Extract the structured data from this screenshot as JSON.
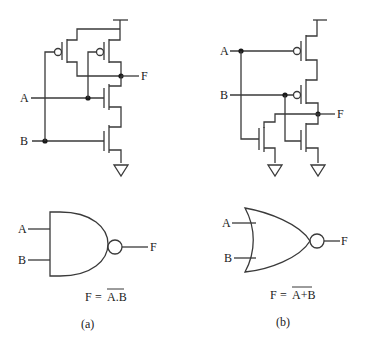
{
  "panels": [
    {
      "id": "a",
      "caption": "(a)",
      "gate_type": "NAND",
      "transistor_circuit": {
        "supply": "VDD",
        "pmos_count": 2,
        "pmos_arrangement": "parallel",
        "nmos_count": 2,
        "nmos_arrangement": "series",
        "inputs": [
          "A",
          "B"
        ],
        "output": "F",
        "ground_count": 1
      },
      "symbol": {
        "inputs": [
          "A",
          "B"
        ],
        "output": "F"
      },
      "equation": {
        "lhs": "F",
        "op": "=",
        "rhs_overlined": "A.B"
      }
    },
    {
      "id": "b",
      "caption": "(b)",
      "gate_type": "NOR",
      "transistor_circuit": {
        "supply": "VDD",
        "pmos_count": 2,
        "pmos_arrangement": "series",
        "nmos_count": 2,
        "nmos_arrangement": "parallel",
        "inputs": [
          "A",
          "B"
        ],
        "output": "F",
        "ground_count": 2
      },
      "symbol": {
        "inputs": [
          "A",
          "B"
        ],
        "output": "F"
      },
      "equation": {
        "lhs": "F",
        "op": "=",
        "rhs_overlined": "A+B"
      }
    }
  ],
  "colors": {
    "wire": "#3a3a3a",
    "text": "#222222",
    "background": "#ffffff"
  }
}
